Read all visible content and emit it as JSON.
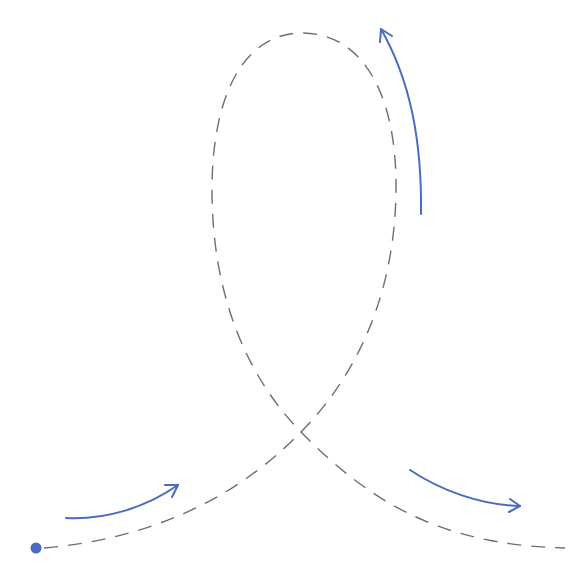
{
  "diagram": {
    "type": "loop-path",
    "colors": {
      "path": "#6e6e6e",
      "arrow": "#4a6bbf",
      "start_dot": "#4a6bbf",
      "background": "#ffffff"
    },
    "start_point": {
      "x": 36,
      "y": 548
    },
    "crossing_point": {
      "x": 301,
      "y": 432
    },
    "loop_top": {
      "x": 302,
      "y": 33
    },
    "end_point": {
      "x": 565,
      "y": 548
    },
    "arrows": [
      {
        "id": "arrow-1",
        "segment": "entry, heading up-right",
        "from": [
          66,
          518
        ],
        "to": [
          178,
          485
        ]
      },
      {
        "id": "arrow-2",
        "segment": "right side of loop, heading up",
        "from": [
          421,
          214
        ],
        "to": [
          381,
          29
        ]
      },
      {
        "id": "arrow-3",
        "segment": "exit, heading down-right",
        "from": [
          410,
          470
        ],
        "to": [
          520,
          506
        ]
      }
    ]
  }
}
